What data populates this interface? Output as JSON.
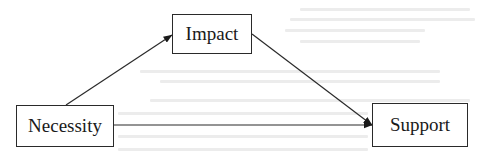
{
  "diagram": {
    "type": "mediation-path-diagram",
    "nodes": [
      {
        "id": "necessity",
        "label": "Necessity"
      },
      {
        "id": "impact",
        "label": "Impact"
      },
      {
        "id": "support",
        "label": "Support"
      }
    ],
    "edges": [
      {
        "from": "necessity",
        "to": "impact",
        "label": ""
      },
      {
        "from": "impact",
        "to": "support",
        "label": ""
      },
      {
        "from": "necessity",
        "to": "support",
        "label": ""
      }
    ],
    "colors": {
      "stroke": "#2a2a2a",
      "text": "#1a1a1a",
      "background": "#ffffff"
    }
  }
}
